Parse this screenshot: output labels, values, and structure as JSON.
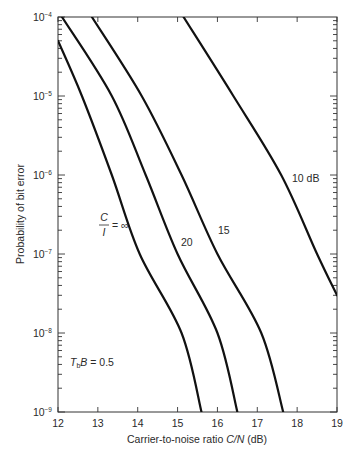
{
  "chart_data": {
    "type": "line",
    "title": "",
    "xlabel": "Carrier-to-noise ratio C/N (dB)",
    "ylabel": "Probability of bit error",
    "xlim": [
      12,
      19
    ],
    "ylim": [
      1e-09,
      0.0001
    ],
    "yscale": "log",
    "grid": false,
    "legend": "inline curve labels",
    "x_ticks": [
      12,
      13,
      14,
      15,
      16,
      17,
      18,
      19
    ],
    "y_ticks": [
      "10^-4",
      "10^-5",
      "10^-6",
      "10^-7",
      "10^-8",
      "10^-9"
    ],
    "annotations": [
      "T_b B = 0.5",
      "C/I = ∞",
      "20",
      "15",
      "10 dB"
    ],
    "series": [
      {
        "name": "C/I = ∞",
        "points": [
          [
            12.0,
            5e-05
          ],
          [
            12.6,
            1e-05
          ],
          [
            13.35,
            1e-06
          ],
          [
            14.05,
            1e-07
          ],
          [
            15.1,
            1e-08
          ],
          [
            15.6,
            1e-09
          ]
        ]
      },
      {
        "name": "C/I = 20 dB",
        "points": [
          [
            12.1,
            0.0001
          ],
          [
            13.35,
            1e-05
          ],
          [
            14.2,
            1e-06
          ],
          [
            15.0,
            1e-07
          ],
          [
            16.0,
            1e-08
          ],
          [
            16.5,
            1e-09
          ]
        ]
      },
      {
        "name": "C/I = 15 dB",
        "points": [
          [
            12.85,
            0.0001
          ],
          [
            14.1,
            1e-05
          ],
          [
            15.1,
            1e-06
          ],
          [
            16.0,
            1e-07
          ],
          [
            17.1,
            1e-08
          ],
          [
            17.65,
            1e-09
          ]
        ]
      },
      {
        "name": "C/I = 10 dB",
        "points": [
          [
            15.15,
            0.0001
          ],
          [
            16.4,
            1e-05
          ],
          [
            17.6,
            1e-06
          ],
          [
            18.5,
            1e-07
          ],
          [
            19.0,
            3e-08
          ]
        ]
      }
    ]
  },
  "labels": {
    "xlabel_prefix": "Carrier-to-noise ratio ",
    "xlabel_var": "C/N",
    "xlabel_unit": " (dB)",
    "ylabel": "Probability of bit error",
    "tb_label_t": "T",
    "tb_label_sub": "b",
    "tb_label_rest": "B = 0.5",
    "ci_num": "C",
    "ci_den": "I",
    "ci_eq": "= ∞",
    "label_20": "20",
    "label_15": "15",
    "label_10": "10 dB",
    "ten": "10",
    "x_ticks": [
      "12",
      "13",
      "14",
      "15",
      "16",
      "17",
      "18",
      "19"
    ],
    "y_exps": [
      "−4",
      "−5",
      "−6",
      "−7",
      "−8",
      "−9"
    ]
  }
}
